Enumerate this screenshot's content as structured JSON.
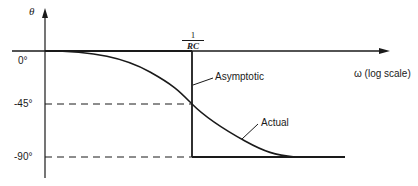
{
  "diagram": {
    "y_axis_label": "θ",
    "x_axis_label": "ω (log scale)",
    "y_ticks": [
      "0°",
      "-45°",
      "-90°"
    ],
    "corner_frequency": {
      "numerator": "1",
      "denominator": "RC"
    },
    "annotations": {
      "asymptotic": "Asymptotic",
      "actual": "Actual"
    },
    "colors": {
      "line": "#1a1a1a",
      "background": "#ffffff"
    }
  }
}
